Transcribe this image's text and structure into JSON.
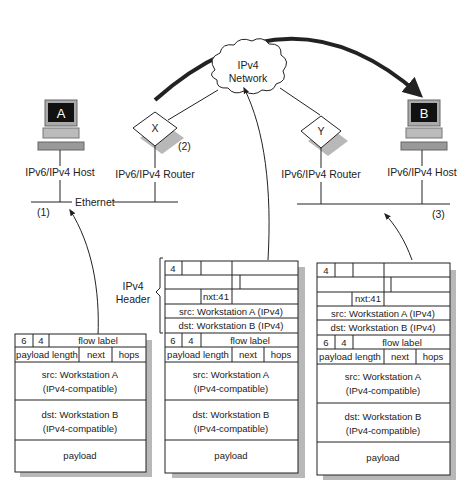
{
  "network": {
    "cloud_label_1": "IPv4",
    "cloud_label_2": "Network",
    "host_a": {
      "letter": "A",
      "label": "IPv6/IPv4 Host"
    },
    "host_b": {
      "letter": "B",
      "label": "IPv6/IPv4 Host"
    },
    "router_x": {
      "letter": "X",
      "label": "IPv6/IPv4 Router",
      "step": "(2)"
    },
    "router_y": {
      "letter": "Y",
      "label": "IPv6/IPv4 Router"
    },
    "ethernet_label": "Ethernet",
    "step_1": "(1)",
    "step_3": "(3)"
  },
  "brace": {
    "line1": "IPv4",
    "line2": "Header"
  },
  "packets": {
    "ipv6": {
      "version": "6",
      "priority": "4",
      "flow_label": "flow label",
      "payload_length": "payload length",
      "next": "next",
      "hops": "hops",
      "src_1": "src: Workstation A",
      "src_2": "(IPv4-compatible)",
      "dst_1": "dst: Workstation B",
      "dst_2": "(IPv4-compatible)",
      "payload": "payload"
    },
    "ipv4": {
      "version": "4",
      "nxt": "nxt:41",
      "src": "src: Workstation A (IPv4)",
      "dst": "dst: Workstation B (IPv4)"
    }
  }
}
